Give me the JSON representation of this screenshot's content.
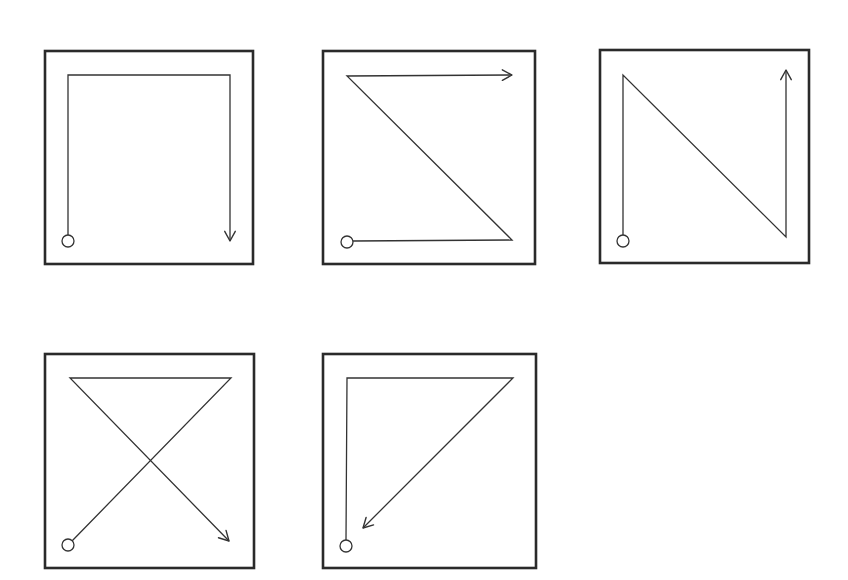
{
  "figure": {
    "colors": {
      "background": "#ffffff",
      "stroke": "#333333",
      "frame": "#2a2a2a"
    },
    "panels": [
      {
        "id": "panel-1",
        "pattern": "inverted-u",
        "frame": {
          "x": 45,
          "y": 51,
          "w": 208,
          "h": 213
        },
        "start": {
          "x": 68,
          "y": 241,
          "r": 6
        },
        "points": [
          [
            68,
            235
          ],
          [
            68,
            75
          ],
          [
            230,
            75
          ],
          [
            230,
            241
          ]
        ],
        "arrow_direction": "down"
      },
      {
        "id": "panel-2",
        "pattern": "z-shape",
        "frame": {
          "x": 323,
          "y": 51,
          "w": 212,
          "h": 213
        },
        "start": {
          "x": 347,
          "y": 242,
          "r": 6
        },
        "points": [
          [
            353,
            241
          ],
          [
            512,
            240
          ],
          [
            347,
            76
          ],
          [
            512,
            75
          ]
        ],
        "arrow_direction": "right"
      },
      {
        "id": "panel-3",
        "pattern": "n-shape",
        "frame": {
          "x": 600,
          "y": 50,
          "w": 209,
          "h": 213
        },
        "start": {
          "x": 623,
          "y": 241,
          "r": 6
        },
        "points": [
          [
            623,
            235
          ],
          [
            623,
            75
          ],
          [
            786,
            237
          ],
          [
            786,
            70
          ]
        ],
        "arrow_direction": "up"
      },
      {
        "id": "panel-4",
        "pattern": "x-crossing",
        "frame": {
          "x": 45,
          "y": 354,
          "w": 209,
          "h": 214
        },
        "start": {
          "x": 68,
          "y": 545,
          "r": 6
        },
        "points": [
          [
            72,
            541
          ],
          [
            231,
            378
          ],
          [
            70,
            378
          ],
          [
            229,
            541
          ]
        ],
        "arrow_direction": "down-right"
      },
      {
        "id": "panel-5",
        "pattern": "triangle",
        "frame": {
          "x": 323,
          "y": 354,
          "w": 213,
          "h": 214
        },
        "start": {
          "x": 346,
          "y": 546,
          "r": 6
        },
        "points": [
          [
            346,
            540
          ],
          [
            347,
            378
          ],
          [
            513,
            378
          ],
          [
            363,
            528
          ]
        ],
        "arrow_direction": "down-left"
      }
    ]
  }
}
